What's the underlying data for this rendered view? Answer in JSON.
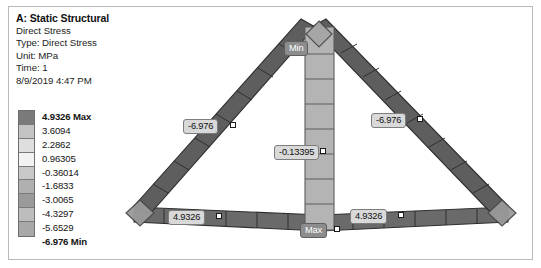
{
  "header": {
    "title": "A: Static Structural",
    "lines": [
      "Direct Stress",
      "Type: Direct Stress",
      "Unit: MPa",
      "Time: 1",
      "8/9/2019 4:47 PM"
    ]
  },
  "legend": {
    "title": "Direct Stress contour legend",
    "unit": "MPa",
    "max_label": "4.9326 Max",
    "min_label": "-6.976 Min",
    "entries": [
      {
        "label": "4.9326 Max",
        "value": 4.9326,
        "bold": true,
        "color": "#7a7a7a"
      },
      {
        "label": "3.6094",
        "value": 3.6094,
        "bold": false,
        "color": "#c3c3c3"
      },
      {
        "label": "2.2862",
        "value": 2.2862,
        "bold": false,
        "color": "#dedede"
      },
      {
        "label": "0.96305",
        "value": 0.96305,
        "bold": false,
        "color": "#f2f2f2"
      },
      {
        "label": "-0.36014",
        "value": -0.36014,
        "bold": false,
        "color": "#c8c8c8"
      },
      {
        "label": "-1.6833",
        "value": -1.6833,
        "bold": false,
        "color": "#b0b0b0"
      },
      {
        "label": "-3.0065",
        "value": -3.0065,
        "bold": false,
        "color": "#9a9a9a"
      },
      {
        "label": "-4.3297",
        "value": -4.3297,
        "bold": false,
        "color": "#bdbdbd"
      },
      {
        "label": "-5.6529",
        "value": -5.6529,
        "bold": false,
        "color": "#a8a8a8"
      },
      {
        "label": "-6.976 Min",
        "value": -6.976,
        "bold": true,
        "color": "#6b6b6b"
      }
    ]
  },
  "model": {
    "name": "triangular-truss",
    "members": [
      {
        "name": "left-diagonal-chord",
        "stress": -6.976,
        "shade": "#5e5e5e"
      },
      {
        "name": "right-diagonal-chord",
        "stress": -6.976,
        "shade": "#5e5e5e"
      },
      {
        "name": "bottom-chord",
        "stress": 4.9326,
        "shade": "#6a6a6a"
      },
      {
        "name": "center-vertical-web",
        "stress": -0.13395,
        "shade": "#b4b4b4"
      }
    ],
    "supports": [
      {
        "name": "left-support",
        "type": "pinned-diamond"
      },
      {
        "name": "right-support",
        "type": "pinned-diamond"
      },
      {
        "name": "apex-load",
        "type": "diamond-marker"
      }
    ]
  },
  "annotations": [
    {
      "name": "probe-left-diagonal",
      "text": "-6.976",
      "style": "light",
      "x": 63,
      "y": 109
    },
    {
      "name": "probe-right-diagonal",
      "text": "-6.976",
      "style": "light",
      "x": 251,
      "y": 103
    },
    {
      "name": "probe-center-vertical",
      "text": "-0.13395",
      "style": "light",
      "x": 154,
      "y": 135
    },
    {
      "name": "probe-bottom-left",
      "text": "4.9326",
      "style": "light",
      "x": 48,
      "y": 200
    },
    {
      "name": "probe-bottom-right",
      "text": "4.9326",
      "style": "light",
      "x": 230,
      "y": 199
    },
    {
      "name": "min-marker",
      "text": "Min",
      "style": "dark",
      "x": 164,
      "y": 31
    },
    {
      "name": "max-marker",
      "text": "Max",
      "style": "dark",
      "x": 180,
      "y": 213
    }
  ],
  "colors": {
    "member_dark": "#5e5e5e",
    "member_bottom": "#6a6a6a",
    "member_light": "#b4b4b4",
    "outline": "#3a3a3a",
    "callout_bg": "#d9d9d9",
    "callout_dark_bg": "#8d8d8d",
    "frame": "#b9b9b9",
    "background": "#ffffff"
  }
}
